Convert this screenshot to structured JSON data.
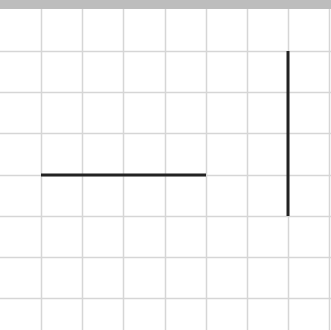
{
  "canvas": {
    "width": 331,
    "height": 330,
    "background": "#ffffff"
  },
  "top_band": {
    "height": 9,
    "color": "#bdbdbd"
  },
  "grid": {
    "color": "#d6d6d6",
    "vertical_x": [
      41,
      82,
      123,
      165,
      206,
      247,
      288,
      329
    ],
    "horizontal_y": [
      51,
      92,
      133,
      175,
      216,
      257,
      298
    ]
  },
  "segments": [
    {
      "name": "horizontal-segment",
      "x1": 41,
      "y1": 175,
      "x2": 206,
      "y2": 175,
      "color": "#222222",
      "width": 3
    },
    {
      "name": "vertical-segment",
      "x1": 288,
      "y1": 51,
      "x2": 288,
      "y2": 216,
      "color": "#222222",
      "width": 3
    }
  ]
}
